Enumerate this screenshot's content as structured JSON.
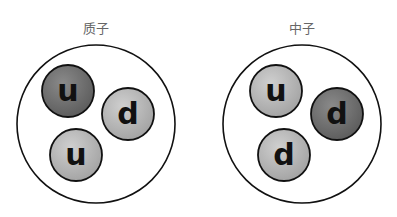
{
  "particles": [
    {
      "name": "质子",
      "quarks": [
        {
          "flavor": "u",
          "shade": "dark"
        },
        {
          "flavor": "d",
          "shade": "light"
        },
        {
          "flavor": "u",
          "shade": "light"
        }
      ]
    },
    {
      "name": "中子",
      "quarks": [
        {
          "flavor": "u",
          "shade": "light"
        },
        {
          "flavor": "d",
          "shade": "dark"
        },
        {
          "flavor": "d",
          "shade": "light"
        }
      ]
    }
  ],
  "colors": {
    "dark_quark": "#6f6f6f",
    "light_quark": "#b3b3b3",
    "outline": "#111111",
    "label": "#666666"
  }
}
